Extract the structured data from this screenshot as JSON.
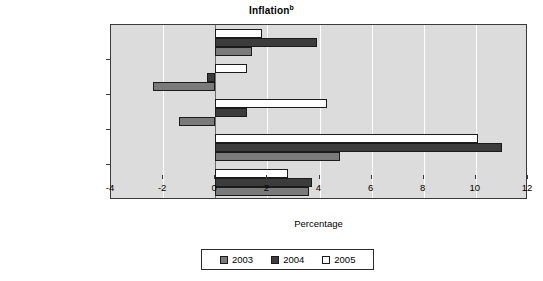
{
  "chart_data": {
    "type": "bar",
    "orientation": "horizontal",
    "title": "Inflation",
    "title_superscript": "b",
    "xlabel": "Percentage",
    "ylabel": "",
    "xlim": [
      -4,
      12
    ],
    "xticks": [
      -4,
      -2,
      0,
      2,
      4,
      6,
      8,
      10,
      12
    ],
    "xtick_labels": [
      "-4",
      "-2",
      "0",
      "2",
      "4",
      "6",
      "8",
      "10",
      "12"
    ],
    "grid": true,
    "legend_position": "bottom",
    "categories": [
      "China",
      "Hong Kong, China",
      "Macao, China",
      "Mongolia",
      "Republic of Korea"
    ],
    "category_superscripts": [
      "",
      "",
      "c",
      "",
      ""
    ],
    "series": [
      {
        "name": "2003",
        "color": "#7a7a7a",
        "values": [
          1.4,
          -2.4,
          -1.4,
          4.8,
          3.6
        ]
      },
      {
        "name": "2004",
        "color": "#3c3c3c",
        "values": [
          3.9,
          -0.3,
          1.2,
          11.0,
          3.7
        ]
      },
      {
        "name": "2005",
        "color": "#ffffff",
        "values": [
          1.8,
          1.2,
          4.3,
          10.1,
          2.8
        ]
      }
    ]
  },
  "legend": {
    "items": [
      {
        "label": "2003"
      },
      {
        "label": "2004"
      },
      {
        "label": "2005"
      }
    ]
  },
  "colors": {
    "plot_background": "#dcdcdc",
    "gridline": "#ffffff",
    "axis": "#3a3a3a",
    "series_2003": "#7a7a7a",
    "series_2004": "#3c3c3c",
    "series_2005": "#ffffff"
  }
}
